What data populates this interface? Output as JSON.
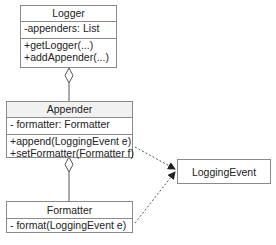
{
  "diagram": {
    "type": "UML class diagram",
    "classes": [
      {
        "name": "Logger",
        "attributes": [
          "-appenders: List"
        ],
        "methods": [
          "+getLogger(...)",
          "+addAppender(...)"
        ]
      },
      {
        "name": "Appender",
        "attributes": [
          "- formatter: Formatter"
        ],
        "methods": [
          "+append(LoggingEvent e)",
          "+setFormatter(Formatter f)"
        ]
      },
      {
        "name": "Formatter",
        "attributes": [],
        "methods": [
          "- format(LoggingEvent e)"
        ]
      },
      {
        "name": "LoggingEvent"
      }
    ],
    "relationships": [
      {
        "from": "Logger",
        "to": "Appender",
        "type": "aggregation"
      },
      {
        "from": "Appender",
        "to": "Formatter",
        "type": "aggregation"
      },
      {
        "from": "Appender",
        "to": "LoggingEvent",
        "type": "dependency"
      },
      {
        "from": "Formatter",
        "to": "LoggingEvent",
        "type": "dependency"
      }
    ]
  },
  "colors": {
    "border": "#8a8a8a",
    "header_fill": "#f1f1f1",
    "line": "#555555"
  }
}
